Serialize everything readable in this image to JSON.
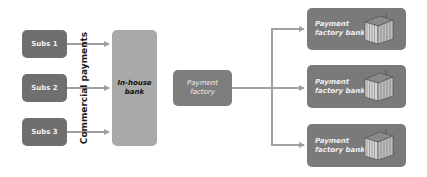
{
  "diagram": {
    "subsidiaries": [
      {
        "label": "Subs 1"
      },
      {
        "label": "Subs 2"
      },
      {
        "label": "Subs 3"
      }
    ],
    "flow_label": "Commercial payments",
    "in_house_bank": {
      "line1": "In-house",
      "line2": "bank"
    },
    "payment_factory": {
      "line1": "Payment",
      "line2": "factory"
    },
    "banks": [
      {
        "line1": "Payment",
        "line2": "factory bank",
        "icon": "bank-building-icon"
      },
      {
        "line1": "Payment",
        "line2": "factory bank",
        "icon": "bank-building-icon"
      },
      {
        "line1": "Payment",
        "line2": "factory bank",
        "icon": "bank-building-icon"
      }
    ],
    "colors": {
      "subs_box": "#6f6f6f",
      "in_house_bank_box": "#a9a9a9",
      "payment_factory_box": "#7d7d7d",
      "bank_box": "#7a7a7a",
      "arrow": "#a0a0a0"
    }
  }
}
